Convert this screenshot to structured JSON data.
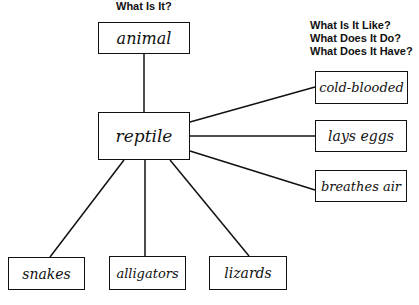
{
  "titles": {
    "left": "What Is It?",
    "right": [
      "What Is It Like?",
      "What Does It Do?",
      "What Does It Have?"
    ]
  },
  "nodes": {
    "category": "animal",
    "center": "reptile",
    "attributes": [
      "cold-blooded",
      "lays eggs",
      "breathes air"
    ],
    "examples": [
      "snakes",
      "alligators",
      "lizards"
    ]
  },
  "edges": [
    [
      "reptile",
      "animal"
    ],
    [
      "reptile",
      "cold-blooded"
    ],
    [
      "reptile",
      "lays eggs"
    ],
    [
      "reptile",
      "breathes air"
    ],
    [
      "reptile",
      "snakes"
    ],
    [
      "reptile",
      "alligators"
    ],
    [
      "reptile",
      "lizards"
    ]
  ],
  "colors": {
    "ink": "#111111",
    "background": "#ffffff"
  }
}
